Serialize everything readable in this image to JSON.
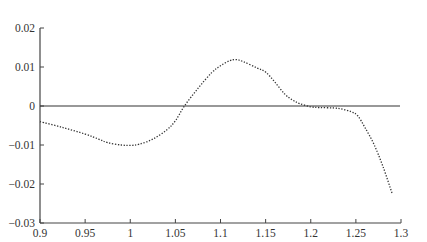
{
  "chart_data": {
    "type": "line",
    "title": "",
    "xlabel": "",
    "ylabel": "Error",
    "xlim": [
      0.9,
      1.3
    ],
    "ylim": [
      -0.03,
      0.02
    ],
    "grid": false,
    "legend": null,
    "x_ticks": [
      0.9,
      0.95,
      1,
      1.05,
      1.1,
      1.15,
      1.2,
      1.25,
      1.3
    ],
    "x_tick_labels": [
      "0.9",
      "0.95",
      "1",
      "1.05",
      "1.1",
      "1.15",
      "1.2",
      "1.25",
      "1.3"
    ],
    "y_ticks": [
      0.02,
      0.01,
      0,
      -0.01,
      -0.02,
      -0.03
    ],
    "y_tick_labels": [
      "0.02",
      "0.01",
      "0",
      "−0.01",
      "−0.02",
      "−0.03"
    ],
    "series": [
      {
        "name": "error",
        "style": "dotted",
        "color": "#333333",
        "x": [
          0.9,
          0.925,
          0.95,
          0.965,
          0.975,
          0.99,
          1.0,
          1.01,
          1.025,
          1.04,
          1.05,
          1.06,
          1.075,
          1.09,
          1.1,
          1.11,
          1.117,
          1.125,
          1.14,
          1.15,
          1.16,
          1.171,
          1.18,
          1.188,
          1.2,
          1.21,
          1.225,
          1.235,
          1.245,
          1.252,
          1.26,
          1.27,
          1.28,
          1.29
        ],
        "y": [
          -0.004,
          -0.0055,
          -0.0072,
          -0.0085,
          -0.0094,
          -0.01,
          -0.0101,
          -0.0098,
          -0.0085,
          -0.0062,
          -0.0038,
          0.0,
          0.0045,
          0.0085,
          0.0103,
          0.0116,
          0.0119,
          0.0114,
          0.0098,
          0.0087,
          0.0062,
          0.0031,
          0.0015,
          0.0006,
          -0.0002,
          -0.0004,
          -0.0005,
          -0.0008,
          -0.0015,
          -0.0025,
          -0.0055,
          -0.0098,
          -0.0155,
          -0.0223
        ]
      },
      {
        "name": "zero-reference",
        "style": "solid",
        "color": "#333333",
        "x": [
          0.9,
          1.3
        ],
        "y": [
          0,
          0
        ]
      }
    ],
    "partial_ylabel_visible": true
  }
}
